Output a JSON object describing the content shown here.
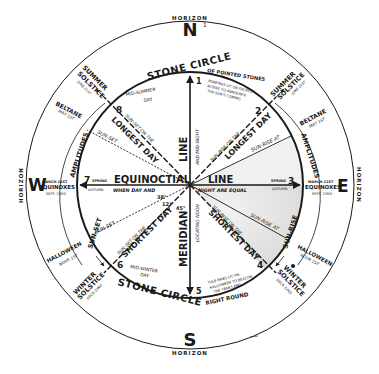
{
  "diagram": {
    "compass": {
      "north": "N",
      "north_marker": "1",
      "south": "S",
      "east": "E",
      "west": "W"
    },
    "horizon": {
      "top": "HORIZON",
      "bottom": "HORIZON",
      "left": "HORIZON",
      "right": "HORIZON"
    },
    "stone_circle": {
      "top_label": "STONE CIRCLE",
      "top_sublabel": "OF POINTED STONES",
      "bottom_label": "STONE CIRCLE",
      "bottom_sublabel": "RIGHT ROUND"
    },
    "axes": {
      "equinoctial_left": "EQUINOCTIAL",
      "equinoctial_right": "LINE",
      "equinoctial_sub_left": "WHEN DAY AND",
      "equinoctial_sub_right": "NIGHT ARE EQUAL",
      "meridian_top": "LINE",
      "meridian_top_sub": "AND MID-NIGHT",
      "meridian_bottom": "MERIDIAN",
      "meridian_bottom_sub": "LOCATING NOON"
    },
    "stones": [
      {
        "n": "1",
        "note": ""
      },
      {
        "n": "2",
        "note": "BONFIRES LIT ON SACRED ALTERS TO ANNOUNCE THE SUN'S COMING"
      },
      {
        "n": "3",
        "note": "SPRING"
      },
      {
        "n": "4",
        "note": ""
      },
      {
        "n": "5",
        "note": ""
      },
      {
        "n": "6",
        "note": "MID-WINTER DAY"
      },
      {
        "n": "7",
        "note": "SPRING / AUTUMN"
      },
      {
        "n": "8",
        "note": "MID-SUMMER DAY"
      }
    ],
    "stone_notes": {
      "three_sub": "AUTUMN",
      "four_note_1": "TULE FIRES LIT ON",
      "four_note_2": "HALLOWEEN TO BEACON",
      "four_note_3": "THE YEARS END",
      "two_note_1": "BONFIRES LIT ON SACRED",
      "two_note_2": "ALTERS TO ANNOUNCE",
      "two_note_3": "THE SUN'S COMING",
      "eight_note_1": "MID-SUMMER",
      "eight_note_2": "DAY",
      "six_note_1": "MID-WINTER",
      "six_note_2": "DAY",
      "seven_spring": "SPRING",
      "seven_autumn": "AUTUMN"
    },
    "rays": {
      "sunset_longest_1": "SUN-SET ON THE",
      "sunset_longest_2": "LONGEST DAY",
      "sunrise_longest_1": "SUN-RISE ON THE",
      "sunrise_longest_2": "LONGEST DAY",
      "sunset_shortest_1": "SUN-SET ON THE",
      "sunset_shortest_2": "SHORTEST DAY",
      "sunrise_shortest_1": "SUN-RISE ON THE",
      "sunrise_shortest_2": "SHORTEST DAY",
      "sunset_upper": "SUN-SET",
      "sunset_lower": "SUN-SET",
      "sunrise_upper": "SUN-RISE AT",
      "sunrise_lower": "SUN-RISE AT"
    },
    "angles": {
      "a38": "38°",
      "a12": "12°",
      "a45": "45°"
    },
    "outer_labels": {
      "summer_solstice_w_1": "SUMMER",
      "summer_solstice_w_2": "SOLSTICE",
      "summer_solstice_w_3": "JUNE 21ST",
      "summer_solstice_e_1": "SUMMER",
      "summer_solstice_e_2": "SOLSTICE",
      "summer_solstice_e_3": "JUNE 21ST",
      "beltane_w_1": "BELTANE",
      "beltane_w_2": "MAY 1ST",
      "beltane_e_1": "BELTANE",
      "beltane_e_2": "MAY 1ST",
      "amplitudes_w": "AMPLITUDES",
      "amplitudes_e": "AMPLITUDES",
      "equinoxes_w_1": "MARCH 21ST",
      "equinoxes_w_2": "EQUINOXES",
      "equinoxes_w_3": "SEPT. 23RD",
      "equinoxes_e_1": "MARCH 21ST",
      "equinoxes_e_2": "EQUINOXES",
      "equinoxes_e_3": "SEPT. 23RD",
      "sunset_w": "SUN-SET",
      "sunrise_e": "SUN-RISE",
      "halloween_w_1": "HALLOWEEN",
      "halloween_w_2": "NOVR 1ST",
      "halloween_e_1": "HALLOWEEN",
      "halloween_e_2": "NOVR 1ST",
      "winter_solstice_w_1": "WINTER",
      "winter_solstice_w_2": "SOLSTICE",
      "winter_solstice_w_3": "DECR 22ND",
      "winter_solstice_e_1": "WINTER",
      "winter_solstice_e_2": "SOLSTICE",
      "winter_solstice_e_3": "DECR 22ND"
    },
    "colors": {
      "ink": "#1a1a1a",
      "paper": "#ffffff",
      "shade": "#d8d8d8"
    }
  }
}
